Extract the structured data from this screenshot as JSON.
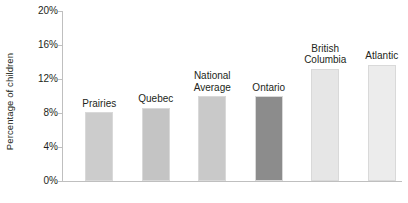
{
  "chart_data": {
    "type": "bar",
    "title": "",
    "subtitle": "",
    "xlabel": "",
    "ylabel": "Percentage of children",
    "ylim": [
      0,
      20
    ],
    "y_tick_labels": [
      "20%",
      "16%",
      "12%",
      "8%",
      "4%",
      "0%"
    ],
    "y_tick_values": [
      20,
      16,
      12,
      8,
      4,
      0
    ],
    "grid": false,
    "legend": "none",
    "value_suffix": "%",
    "categories": [
      "Prairies",
      "Quebec",
      "National Average",
      "Ontario",
      "British Columbia",
      "Atlantic"
    ],
    "values": [
      8.1,
      8.6,
      10.0,
      10.0,
      13.2,
      13.7
    ],
    "bar_colors": [
      "#cccccc",
      "#c4c4c4",
      "#c9c9c9",
      "#8c8c8c",
      "#e6e6e6",
      "#ececec"
    ],
    "bars": [
      {
        "label": "Prairies",
        "label_lines": [
          "Prairies"
        ],
        "value": 8.1,
        "color": "#cccccc"
      },
      {
        "label": "Quebec",
        "label_lines": [
          "Quebec"
        ],
        "value": 8.6,
        "color": "#c4c4c4"
      },
      {
        "label": "National Average",
        "label_lines": [
          "National",
          "Average"
        ],
        "value": 10.0,
        "color": "#c9c9c9"
      },
      {
        "label": "Ontario",
        "label_lines": [
          "Ontario"
        ],
        "value": 10.0,
        "color": "#8c8c8c"
      },
      {
        "label": "British Columbia",
        "label_lines": [
          "British",
          "Columbia"
        ],
        "value": 13.2,
        "color": "#e6e6e6"
      },
      {
        "label": "Atlantic",
        "label_lines": [
          "Atlantic"
        ],
        "value": 13.7,
        "color": "#ececec"
      }
    ]
  },
  "axis": {
    "y_title": "Percentage of children",
    "ticks": [
      {
        "label": "20%",
        "value": 20
      },
      {
        "label": "16%",
        "value": 16
      },
      {
        "label": "12%",
        "value": 12
      },
      {
        "label": "8%",
        "value": 8
      },
      {
        "label": "4%",
        "value": 4
      },
      {
        "label": "0%",
        "value": 0
      }
    ]
  },
  "colors": {
    "axis_line": "#bfbfbf",
    "text": "#231f20",
    "background": "#ffffff",
    "highlight_bar": "#8c8c8c"
  }
}
